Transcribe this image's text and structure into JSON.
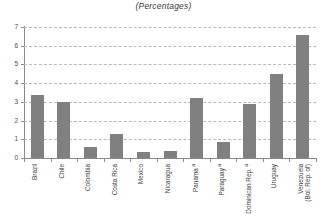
{
  "chart_data": {
    "type": "bar",
    "title": "(Percentages)",
    "xlabel": "",
    "ylabel": "",
    "ylim": [
      0,
      7
    ],
    "yticks": [
      0,
      1,
      2,
      3,
      4,
      5,
      6,
      7
    ],
    "ytick_labels": [
      "0",
      "1",
      "2",
      "3",
      "4",
      "5",
      "6",
      "7"
    ],
    "grid": true,
    "legend": false,
    "bar_color": "#808080",
    "categories": [
      "Brazil",
      "Chile",
      "Colombia",
      "Costa Rica",
      "Mexico",
      "Nicaragua",
      "Panama",
      "Paraguay",
      "Dominican Rep.",
      "Uruguay",
      "Venezuela (Bol. Rep. of)"
    ],
    "category_labels": [
      {
        "line1": "Brazil",
        "line2": "",
        "footnote": ""
      },
      {
        "line1": "Chile",
        "line2": "",
        "footnote": ""
      },
      {
        "line1": "Colombia",
        "line2": "",
        "footnote": ""
      },
      {
        "line1": "Costa Rica",
        "line2": "",
        "footnote": ""
      },
      {
        "line1": "Mexico",
        "line2": "",
        "footnote": ""
      },
      {
        "line1": "Nicaragua",
        "line2": "",
        "footnote": ""
      },
      {
        "line1": "Panama",
        "line2": "",
        "footnote": "a"
      },
      {
        "line1": "Paraguay",
        "line2": "",
        "footnote": "a"
      },
      {
        "line1": "Dominican Rep.",
        "line2": "",
        "footnote": "a"
      },
      {
        "line1": "Uruguay",
        "line2": "",
        "footnote": ""
      },
      {
        "line1": "Venezuela",
        "line2": "(Bol. Rep. of)",
        "footnote": ""
      }
    ],
    "values": [
      3.35,
      3.0,
      0.6,
      1.3,
      0.3,
      0.35,
      3.2,
      0.85,
      2.9,
      4.5,
      6.6
    ]
  }
}
